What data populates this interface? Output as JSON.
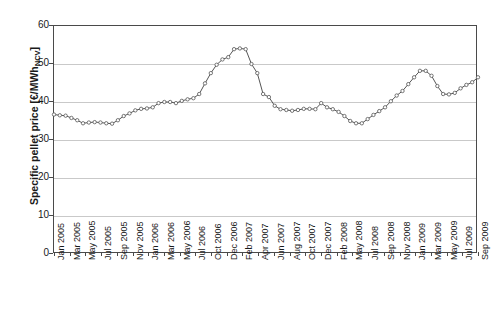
{
  "top_remnant": "",
  "chart_data": {
    "type": "line",
    "title": "",
    "xlabel": "",
    "ylabel": "Specific pellet price [€/MWh",
    "ylabel_sub": "NCV",
    "ylabel_suffix": "]",
    "ylim": [
      0,
      60
    ],
    "ytick_step": 10,
    "yticks": [
      0,
      10,
      20,
      30,
      40,
      50,
      60
    ],
    "grid": true,
    "gridlines_at": [
      10,
      20,
      30,
      40,
      50
    ],
    "legend": null,
    "marker": "open-circle",
    "line_color": "#555555",
    "grid_color": "#c9c9c9",
    "axis_color": "#4a4a4a",
    "x_tick_labels": [
      "Jan 2005",
      "Mar 2005",
      "May 2005",
      "Jul 2005",
      "Sep 2005",
      "Nov 2005",
      "Jan 2006",
      "Mar 2006",
      "May 2006",
      "Jul 2006",
      "Oct 2006",
      "Dec 2006",
      "Feb 2007",
      "Apr 2007",
      "Jun 2007",
      "Aug 2007",
      "Oct 2007",
      "Dec 2007",
      "Feb 2008",
      "May 2008",
      "Jul 2008",
      "Sep 2008",
      "Nov 2008",
      "Jan 2009",
      "Mar 2009",
      "May 2009",
      "Jul 2009",
      "Sep 2009"
    ],
    "x": [
      "Jan 2005",
      "Feb 2005",
      "Mar 2005",
      "Apr 2005",
      "May 2005",
      "Jun 2005",
      "Jul 2005",
      "Aug 2005",
      "Sep 2005",
      "Oct 2005",
      "Nov 2005",
      "Dec 2005",
      "Jan 2006",
      "Feb 2006",
      "Mar 2006",
      "Apr 2006",
      "May 2006",
      "Jun 2006",
      "Jul 2006",
      "Aug 2006",
      "Sep 2006",
      "Oct 2006",
      "Nov 2006",
      "Dec 2006",
      "Jan 2007",
      "Feb 2007",
      "Mar 2007",
      "Apr 2007",
      "May 2007",
      "Jun 2007",
      "Jul 2007",
      "Aug 2007",
      "Sep 2007",
      "Oct 2007",
      "Nov 2007",
      "Dec 2007",
      "Jan 2008",
      "Feb 2008",
      "Mar 2008",
      "Apr 2008",
      "May 2008",
      "Jun 2008",
      "Jul 2008",
      "Aug 2008",
      "Sep 2008",
      "Oct 2008",
      "Nov 2008",
      "Dec 2008",
      "Jan 2009",
      "Feb 2009",
      "Mar 2009",
      "Apr 2009",
      "May 2009",
      "Jun 2009",
      "Jul 2009",
      "Aug 2009",
      "Sep 2009"
    ],
    "values": [
      36.7,
      36.5,
      36.4,
      35.8,
      35.2,
      34.4,
      34.6,
      34.7,
      34.6,
      34.4,
      34.3,
      35.2,
      36.3,
      37.0,
      37.8,
      38.2,
      38.3,
      38.6,
      39.7,
      40.0,
      40.0,
      39.7,
      40.3,
      40.7,
      41.0,
      42.1,
      44.9,
      47.6,
      49.8,
      51.2,
      51.8,
      53.9,
      54.1,
      53.9,
      50.0,
      47.6,
      42.1,
      41.3,
      39.0,
      38.1,
      37.9,
      37.7,
      37.9,
      38.2,
      38.2,
      38.1,
      39.7,
      38.6,
      38.1,
      37.4,
      36.3,
      35.0,
      34.4,
      34.4,
      35.5,
      36.6,
      37.6
    ],
    "values_tail": [
      38.6,
      40.2,
      41.7,
      42.9,
      44.7,
      46.5,
      48.2,
      48.2,
      46.9,
      44.2,
      42.1,
      42.0,
      42.4,
      43.6,
      44.5,
      45.2,
      46.5
    ]
  }
}
